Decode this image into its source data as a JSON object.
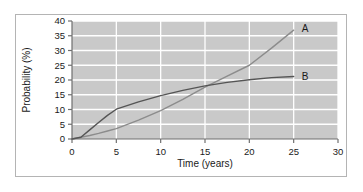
{
  "chart_data": {
    "type": "line",
    "title": "",
    "xlabel": "Time (years)",
    "ylabel": "Probability (%)",
    "xlim": [
      0,
      30
    ],
    "ylim": [
      0,
      40
    ],
    "xticks": [
      0,
      5,
      10,
      15,
      20,
      25,
      30
    ],
    "yticks": [
      0,
      5,
      10,
      15,
      20,
      25,
      30,
      35,
      40
    ],
    "xtick_labels": [
      "0",
      "5",
      "10",
      "15",
      "20",
      "25",
      "30"
    ],
    "ytick_labels": [
      "0",
      "5",
      "10",
      "15",
      "20",
      "25",
      "30",
      "35",
      "40"
    ],
    "grid": "horizontal-and-vertical",
    "legend_position": "inline-right-end-of-curve",
    "plot_background": "#c9c9c9",
    "grid_color": "#ffffff",
    "figure_background": "#ffffff",
    "frame_color": "#b4b4b4",
    "series": [
      {
        "name": "A",
        "label": "A",
        "color": "#8c8c8c",
        "label_x": 25.9,
        "label_y": 37.6,
        "x": [
          1,
          2,
          3,
          4,
          5,
          7.5,
          10,
          12.5,
          15,
          17.5,
          20,
          22.5,
          25
        ],
        "values": [
          0.6,
          1.2,
          1.9,
          2.7,
          3.5,
          6.4,
          9.6,
          13.4,
          17.6,
          21.3,
          25.0,
          30.8,
          36.9
        ]
      },
      {
        "name": "B",
        "label": "B",
        "color": "#555555",
        "label_x": 25.9,
        "label_y": 21.3,
        "x": [
          1,
          2,
          3,
          4,
          5,
          7.5,
          10,
          12.5,
          15,
          17.5,
          20,
          22.5,
          25
        ],
        "values": [
          0.6,
          3.1,
          5.6,
          8.0,
          10.1,
          12.6,
          14.7,
          16.5,
          18.0,
          19.2,
          20.1,
          20.8,
          21.2
        ]
      }
    ],
    "annotations": [
      {
        "name": "crossing-point",
        "x": 15,
        "y": 18,
        "text": ""
      }
    ]
  }
}
